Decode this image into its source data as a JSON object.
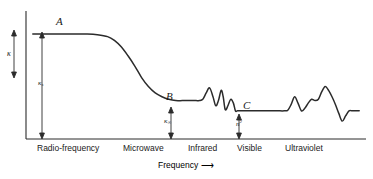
{
  "figure": {
    "ink_color": "#2b2b2b",
    "background": "#ffffff"
  },
  "axes": {
    "y_label": "κ",
    "x_title": "Frequency",
    "x_arrow_glyph": "⟶",
    "x_tick_labels": [
      "Radio-frequency",
      "Microwave",
      "Infrared",
      "Visible",
      "Ultraviolet"
    ]
  },
  "annotations": {
    "region_a": "A",
    "region_b": "B",
    "region_c": "C",
    "kappa_s": "κ",
    "kappa_s_sub": "s",
    "kappa_inf": "κ",
    "kappa_inf_sub": "∞",
    "n_squared": "n",
    "n_squared_sup": "2"
  },
  "chart_data": {
    "type": "line",
    "xlabel": "Frequency",
    "ylabel": "κ",
    "grid": false,
    "legend": null,
    "xlim": [
      0,
      100
    ],
    "ylim": [
      0,
      100
    ],
    "x_tick_positions": [
      10,
      37,
      55,
      66,
      82
    ],
    "x_tick_labels": [
      "Radio-frequency",
      "Microwave",
      "Infrared",
      "Visible",
      "Ultraviolet"
    ],
    "plateaus": [
      {
        "name": "A",
        "label": "κ_s",
        "level": 82,
        "x_start": 2,
        "x_end": 25
      },
      {
        "name": "B",
        "label": "κ_∞",
        "level": 30,
        "x_start": 42,
        "x_end": 54
      },
      {
        "name": "C",
        "label": "n²",
        "level": 22,
        "x_start": 62,
        "x_end": 76
      }
    ],
    "series": [
      {
        "name": "dielectric constant",
        "x": [
          2,
          6,
          10,
          14,
          18,
          21,
          24,
          26,
          28,
          30,
          32,
          34,
          36,
          38,
          40,
          42,
          44,
          46,
          48,
          50,
          51,
          52,
          53,
          54,
          55,
          55.8,
          56.6,
          57.4,
          58,
          58.6,
          59.4,
          60.2,
          61,
          61.6,
          62.2,
          63,
          64,
          66,
          68,
          70,
          72,
          74,
          76,
          77,
          78,
          79,
          80,
          81,
          82,
          83,
          84,
          85,
          86,
          87,
          88,
          89,
          90,
          91,
          92,
          93,
          94,
          95,
          96,
          98
        ],
        "y": [
          82,
          82,
          82,
          82,
          82,
          81.5,
          80,
          77,
          72,
          65,
          57,
          48,
          41,
          36,
          33,
          31,
          30,
          30,
          30,
          30,
          30,
          31,
          36,
          40,
          33,
          26,
          30,
          38,
          33,
          23,
          26,
          31,
          28,
          22,
          22,
          22,
          22,
          22,
          22,
          22,
          22,
          22,
          22,
          22.5,
          27,
          33,
          28,
          22,
          24,
          28,
          31,
          30,
          31,
          37,
          41,
          38,
          33,
          27,
          20,
          14,
          18,
          22,
          22,
          22
        ]
      }
    ]
  }
}
